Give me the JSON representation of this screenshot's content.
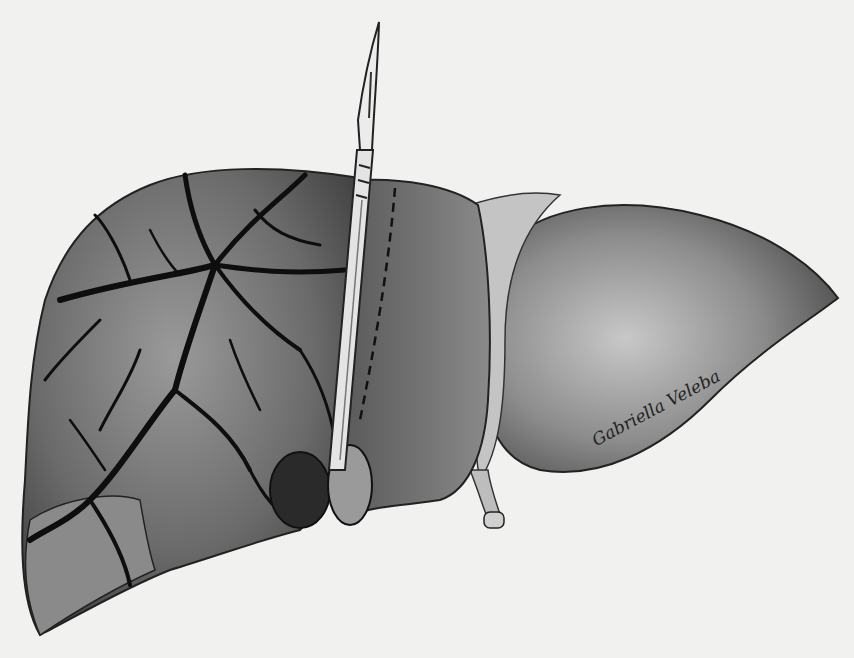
{
  "illustration": {
    "subject": "Liver with scalpel incision",
    "signature": "Gabriella Veleba",
    "colors": {
      "background": "#f1f1ef",
      "tissue_dark": "#3a3a3a",
      "tissue_mid": "#7a7a7a",
      "tissue_light": "#b5b5b5",
      "fissure": "#111111"
    }
  }
}
